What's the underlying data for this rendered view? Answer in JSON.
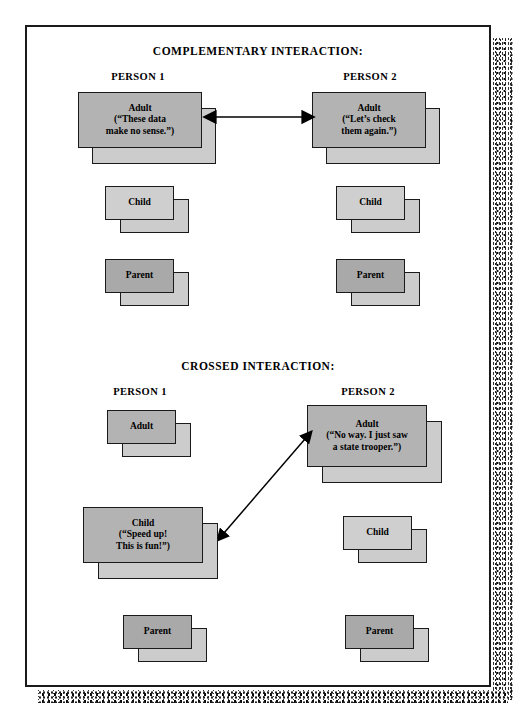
{
  "figure": {
    "sections": [
      {
        "id": "complementary",
        "heading": "COMPLEMENTARY INTERACTION:",
        "columns": [
          {
            "id": "person-1",
            "label": "PERSON 1",
            "boxes": [
              {
                "id": "adult",
                "title": "Adult",
                "quote_lines": [
                  "(“These data",
                  "make no sense.”)"
                ],
                "shade": "mid"
              },
              {
                "id": "child",
                "title": "Child",
                "quote_lines": [],
                "shade": "light"
              },
              {
                "id": "parent",
                "title": "Parent",
                "quote_lines": [],
                "shade": "dark"
              }
            ]
          },
          {
            "id": "person-2",
            "label": "PERSON 2",
            "boxes": [
              {
                "id": "adult",
                "title": "Adult",
                "quote_lines": [
                  "(“Let’s check",
                  "them again.”)"
                ],
                "shade": "mid"
              },
              {
                "id": "child",
                "title": "Child",
                "quote_lines": [],
                "shade": "light"
              },
              {
                "id": "parent",
                "title": "Parent",
                "quote_lines": [],
                "shade": "dark"
              }
            ]
          }
        ],
        "arrow": {
          "id": "adult-to-adult",
          "style": "double-headed-horizontal"
        }
      },
      {
        "id": "crossed",
        "heading": "CROSSED INTERACTION:",
        "columns": [
          {
            "id": "person-1",
            "label": "PERSON 1",
            "boxes": [
              {
                "id": "adult",
                "title": "Adult",
                "quote_lines": [],
                "shade": "mid"
              },
              {
                "id": "child",
                "title": "Child",
                "quote_lines": [
                  "(“Speed up!",
                  "This is fun!”)"
                ],
                "shade": "mid"
              },
              {
                "id": "parent",
                "title": "Parent",
                "quote_lines": [],
                "shade": "dark"
              }
            ]
          },
          {
            "id": "person-2",
            "label": "PERSON 2",
            "boxes": [
              {
                "id": "adult",
                "title": "Adult",
                "quote_lines": [
                  "(“No way. I just saw",
                  "a state trooper.”)"
                ],
                "shade": "mid"
              },
              {
                "id": "child",
                "title": "Child",
                "quote_lines": [],
                "shade": "light"
              },
              {
                "id": "parent",
                "title": "Parent",
                "quote_lines": [],
                "shade": "dark"
              }
            ]
          }
        ],
        "arrow": {
          "id": "child-to-adult",
          "style": "double-headed-diagonal"
        }
      }
    ],
    "colors": {
      "ink": "#1a1a1a",
      "box_back": "#cccccc",
      "box_light": "#cfcfcf",
      "box_mid": "#b3b3b3",
      "box_dark": "#a9a9a9",
      "page": "#ffffff"
    }
  }
}
